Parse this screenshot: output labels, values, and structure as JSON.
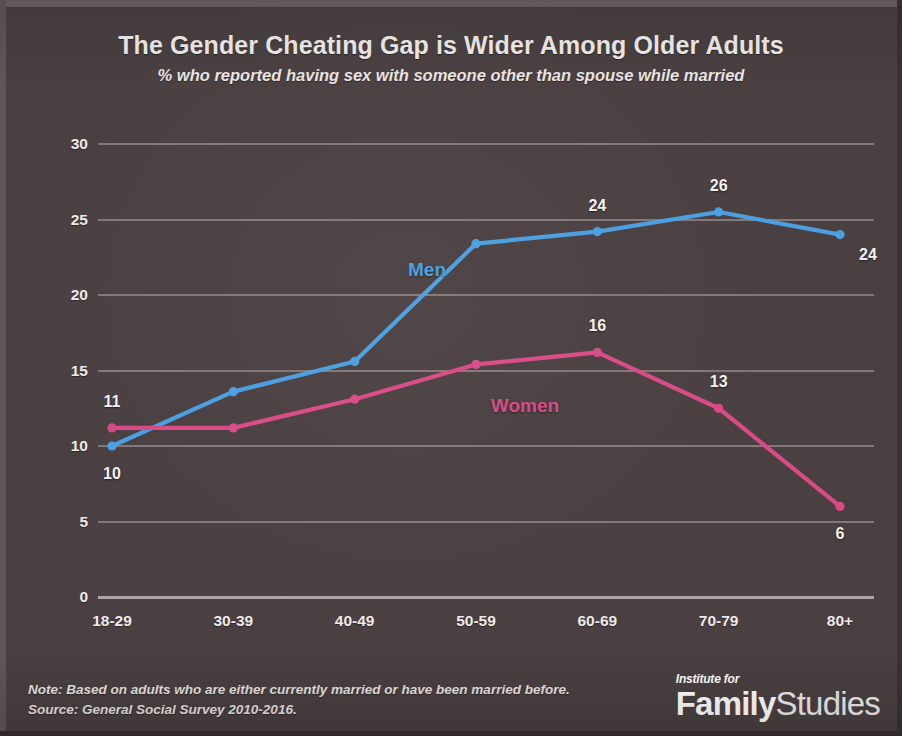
{
  "header": {
    "title": "The Gender Cheating Gap is Wider Among Older Adults",
    "subtitle": "% who reported having sex with someone other than spouse while married"
  },
  "footer": {
    "note": "Note: Based on adults who are either currently married or have been married before.",
    "source": "Source: General Social Survey 2010-2016."
  },
  "logo": {
    "kicker": "Institute for",
    "word1": "Family",
    "word2": "Studies"
  },
  "colors": {
    "background": "#4a4042",
    "men": "#4a9fe0",
    "women": "#d94a87",
    "gridline": "#8d8183",
    "text": "#f2eeec"
  },
  "chart_data": {
    "type": "line",
    "title": "The Gender Cheating Gap is Wider Among Older Adults",
    "subtitle": "% who reported having sex with someone other than spouse while married",
    "xlabel": "",
    "ylabel": "",
    "categories": [
      "18-29",
      "30-39",
      "40-49",
      "50-59",
      "60-69",
      "70-79",
      "80+"
    ],
    "ylim": [
      0,
      30
    ],
    "yticks": [
      0,
      5,
      10,
      15,
      20,
      25,
      30
    ],
    "grid": true,
    "legend": "inline-series-labels",
    "series": [
      {
        "name": "Men",
        "color": "#4a9fe0",
        "values": [
          10,
          13.6,
          15.6,
          23.4,
          24.2,
          25.5,
          24
        ],
        "labels": [
          {
            "category": "18-29",
            "text": "10",
            "position": "below"
          },
          {
            "category": "60-69",
            "text": "24",
            "position": "above"
          },
          {
            "category": "70-79",
            "text": "26",
            "position": "above"
          },
          {
            "category": "80+",
            "text": "24",
            "position": "right-below"
          }
        ]
      },
      {
        "name": "Women",
        "color": "#d94a87",
        "values": [
          11.2,
          11.2,
          13.1,
          15.4,
          16.2,
          12.5,
          6
        ],
        "labels": [
          {
            "category": "18-29",
            "text": "11",
            "position": "above"
          },
          {
            "category": "60-69",
            "text": "16",
            "position": "above"
          },
          {
            "category": "70-79",
            "text": "13",
            "position": "above"
          },
          {
            "category": "80+",
            "text": "6",
            "position": "below"
          }
        ]
      }
    ],
    "annotations": [
      {
        "text": "Men",
        "color": "#4a9fe0"
      },
      {
        "text": "Women",
        "color": "#d94a87"
      }
    ]
  }
}
